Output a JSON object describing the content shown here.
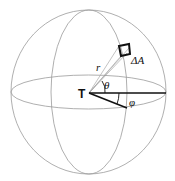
{
  "diagram": {
    "type": "spherical-coordinates",
    "labels": {
      "origin": "T",
      "radius": "r",
      "area_element": "ΔA",
      "polar_angle": "θ",
      "azimuth_angle": "φ"
    },
    "colors": {
      "sphere_lines": "#9a9a9a",
      "vectors": "#111111",
      "background": "#ffffff"
    }
  }
}
